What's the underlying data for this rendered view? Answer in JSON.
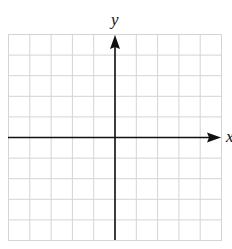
{
  "diagram": {
    "type": "coordinate-grid",
    "grid": {
      "columns": 10,
      "rows": 10,
      "line_color": "#d4d4d4"
    },
    "axes": {
      "x_label": "x",
      "y_label": "y",
      "color": "#111111"
    }
  }
}
